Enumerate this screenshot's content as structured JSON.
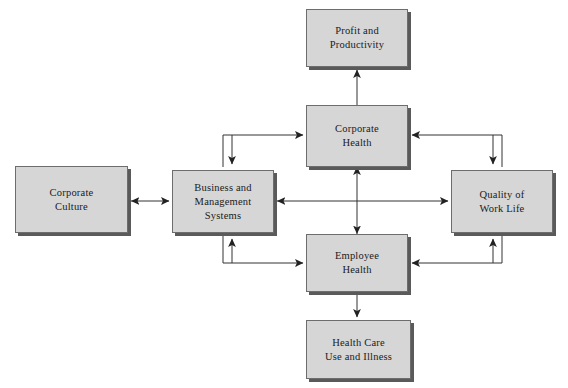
{
  "diagram": {
    "background_color": "#ffffff",
    "node_fill": "#d6d6d6",
    "node_border": "#6d6d6d",
    "shadow_color": "#5a5a5a",
    "line_color": "#333333",
    "nodes": [
      {
        "id": "profit-and-productivity",
        "label": "Profit and\nProductivity",
        "x": 306,
        "y": 9,
        "w": 102,
        "h": 58
      },
      {
        "id": "corporate-health",
        "label": "Corporate\nHealth",
        "x": 306,
        "y": 105,
        "h": 62,
        "w": 102
      },
      {
        "id": "business-and-management-systems",
        "label": "Business and\nManagement\nSystems",
        "x": 172,
        "y": 170,
        "w": 102,
        "h": 63
      },
      {
        "id": "corporate-culture",
        "label": "Corporate\nCulture",
        "x": 15,
        "y": 166,
        "w": 113,
        "h": 67
      },
      {
        "id": "quality-of-work-life",
        "label": "Quality of\nWork Life",
        "x": 451,
        "y": 170,
        "w": 102,
        "h": 63
      },
      {
        "id": "employee-health",
        "label": "Employee\nHealth",
        "x": 306,
        "y": 234,
        "w": 102,
        "h": 58
      },
      {
        "id": "health-care-use-and-illness",
        "label": "Health Care\nUse and Illness",
        "x": 306,
        "y": 320,
        "w": 105,
        "h": 59
      }
    ],
    "edges": [
      {
        "id": "corporate-health-to-profit",
        "from": "corporate-health",
        "to": "profit-and-productivity",
        "arrows": "end",
        "direction": "up"
      },
      {
        "id": "corporate-health-employee-health",
        "from": "corporate-health",
        "to": "employee-health",
        "arrows": "both",
        "direction": "vertical"
      },
      {
        "id": "employee-health-to-health-care",
        "from": "employee-health",
        "to": "health-care-use-and-illness",
        "arrows": "end",
        "direction": "down"
      },
      {
        "id": "corporate-culture-business-systems",
        "from": "corporate-culture",
        "to": "business-and-management-systems",
        "arrows": "both",
        "direction": "horizontal"
      },
      {
        "id": "business-systems-quality-of-work-life",
        "from": "business-and-management-systems",
        "to": "quality-of-work-life",
        "arrows": "both",
        "direction": "horizontal"
      },
      {
        "id": "business-systems-corporate-health",
        "from": "business-and-management-systems",
        "to": "corporate-health",
        "arrows": "both",
        "direction": "elbow-top-left"
      },
      {
        "id": "business-systems-employee-health",
        "from": "business-and-management-systems",
        "to": "employee-health",
        "arrows": "both",
        "direction": "elbow-bottom-left"
      },
      {
        "id": "quality-of-work-life-corporate-health",
        "from": "quality-of-work-life",
        "to": "corporate-health",
        "arrows": "both",
        "direction": "elbow-top-right"
      },
      {
        "id": "quality-of-work-life-employee-health",
        "from": "quality-of-work-life",
        "to": "employee-health",
        "arrows": "both",
        "direction": "elbow-bottom-right"
      }
    ]
  }
}
